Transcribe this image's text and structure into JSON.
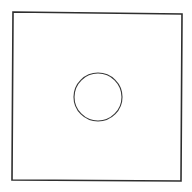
{
  "diagram": {
    "background": "#ffffff",
    "square": {
      "shape": "square-outline",
      "points": "13,12 182,14 181,181 12,180",
      "stroke": "#2e2e2e",
      "stroke_width": 1.6
    },
    "circle": {
      "shape": "circle-outline",
      "cx": 98,
      "cy": 97,
      "r": 24,
      "stroke": "#3a3a3a",
      "stroke_width": 1.1
    }
  }
}
